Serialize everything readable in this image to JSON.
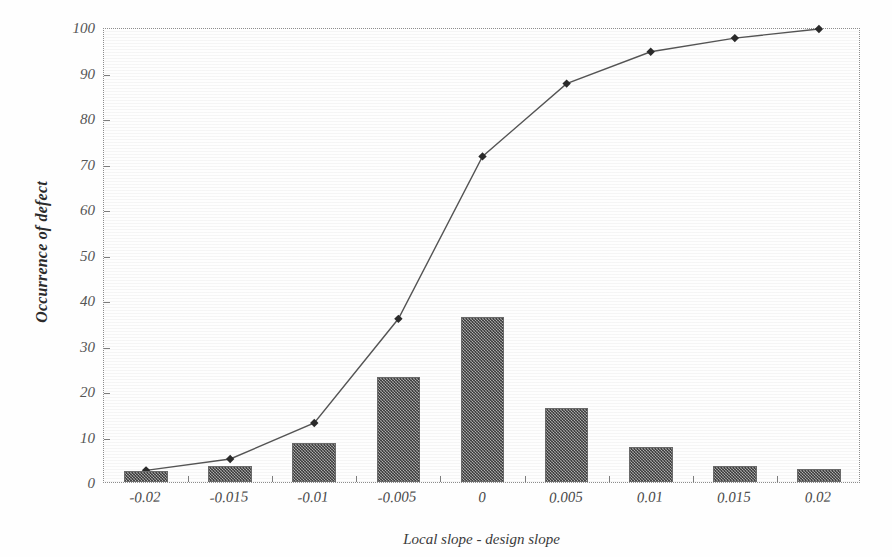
{
  "chart_data": {
    "type": "bar",
    "title": "",
    "xlabel": "Local slope - design slope",
    "ylabel": "Occurrence of defect",
    "categories": [
      "-0.02",
      "-0.015",
      "-0.01",
      "-0.005",
      "0",
      "0.005",
      "0.01",
      "0.015",
      "0.02"
    ],
    "values": [
      2.5,
      3.5,
      8.5,
      23,
      36.3,
      16.2,
      7.6,
      3.6,
      2.8
    ],
    "series": [
      {
        "name": "Occurrence of defect",
        "type": "bar",
        "values": [
          2.5,
          3.5,
          8.5,
          23,
          36.3,
          16.2,
          7.6,
          3.6,
          2.8
        ]
      },
      {
        "name": "Cumulative percentage",
        "type": "line",
        "values": [
          3,
          5.5,
          13.4,
          36.3,
          72,
          88,
          95,
          98,
          100
        ]
      }
    ],
    "ylim": [
      0,
      100
    ],
    "yticks": [
      "0",
      "10",
      "20",
      "30",
      "40",
      "50",
      "60",
      "70",
      "80",
      "90",
      "100"
    ],
    "ytick_values": [
      0,
      10,
      20,
      30,
      40,
      50,
      60,
      70,
      80,
      90,
      100
    ],
    "grid": false,
    "legend": "none",
    "colors": {
      "bar_fill": "#7d7d7d",
      "bar_edge": "#6a6a6a",
      "line": "#555555",
      "marker": "#2b2b2b",
      "axis": "#8d8d8d",
      "text": "#3a3a3a",
      "background": "#fefefe"
    }
  }
}
